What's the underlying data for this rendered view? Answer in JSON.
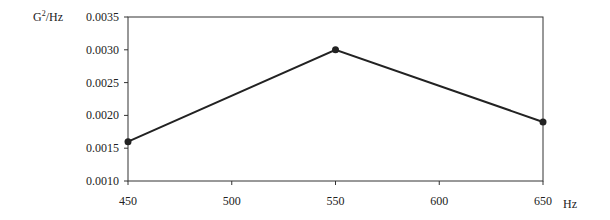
{
  "chart_data": {
    "type": "line",
    "title": "",
    "xlabel": "Hz",
    "ylabel": "G²/Hz",
    "x": [
      450,
      550,
      650
    ],
    "series": [
      {
        "name": "PSD",
        "values": [
          0.0016,
          0.003,
          0.0019
        ]
      }
    ],
    "xlim": [
      450,
      650
    ],
    "ylim": [
      0.001,
      0.0035
    ],
    "xticks": [
      "450",
      "500",
      "550",
      "600",
      "650"
    ],
    "yticks": [
      "0.0010",
      "0.0015",
      "0.0020",
      "0.0025",
      "0.0030",
      "0.0035"
    ],
    "grid": false,
    "legend": null,
    "markers": "filled-circle",
    "line_color": "#222222"
  },
  "axes": {
    "y_unit": "G",
    "y_unit_sup": "2",
    "y_unit_rest": "/Hz",
    "x_unit": "Hz"
  }
}
